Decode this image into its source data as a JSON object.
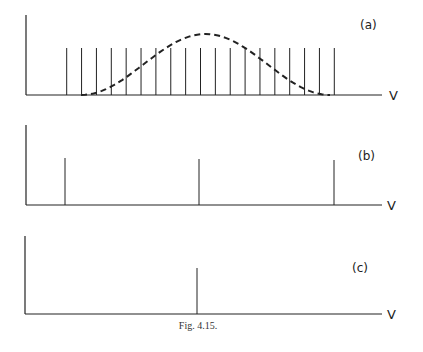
{
  "figure": {
    "caption": "Fig. 4.15.",
    "axis_label": "V",
    "line_color": "#222222"
  },
  "panels": [
    {
      "id": "a",
      "label": "(a)",
      "description": "Comb of equally spaced lines with a dashed bell-shaped envelope",
      "axis": {
        "x": 26,
        "top": 15,
        "baseline": 95,
        "end": 382
      },
      "label_pos": {
        "x": 360,
        "y": 29
      },
      "v_pos": {
        "x": 389,
        "y": 100
      },
      "lines": {
        "count": 19,
        "x_start": 66.7,
        "x_end": 334.3,
        "top": 48
      },
      "envelope": {
        "x_start": 81,
        "x_peak": 200,
        "x_end": 330,
        "peak_y": 34
      }
    },
    {
      "id": "b",
      "label": "(b)",
      "description": "Three lines: left, center, right",
      "axis": {
        "x": 26,
        "top": 125,
        "baseline": 205,
        "end": 382
      },
      "label_pos": {
        "x": 358,
        "y": 160
      },
      "v_pos": {
        "x": 387,
        "y": 210
      },
      "line_x": [
        65,
        199,
        334
      ],
      "line_top": [
        158,
        159,
        160
      ]
    },
    {
      "id": "c",
      "label": "(c)",
      "description": "Single central line",
      "axis": {
        "x": 25,
        "top": 236,
        "baseline": 314,
        "end": 382
      },
      "label_pos": {
        "x": 352,
        "y": 272
      },
      "v_pos": {
        "x": 387,
        "y": 319
      },
      "line_x": [
        197
      ],
      "line_top": [
        268
      ]
    }
  ],
  "caption_pos": {
    "x": 198,
    "y": 329
  }
}
